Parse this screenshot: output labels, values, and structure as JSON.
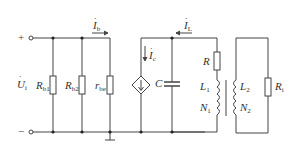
{
  "diagram": {
    "type": "small-signal equivalent circuit (tuned amplifier with transformer-coupled load)",
    "colors": {
      "wire": "#444444",
      "background": "#ffffff",
      "text": "#333333"
    },
    "terminals": {
      "plus": "+",
      "minus": "−",
      "input_voltage": {
        "main": "U",
        "sub": "i",
        "dot": "·"
      }
    },
    "components": {
      "rb1": {
        "main": "R",
        "sub": "b1"
      },
      "rb2": {
        "main": "R",
        "sub": "b2"
      },
      "rbe": {
        "main": "r",
        "sub": "be"
      },
      "ib": {
        "main": "I",
        "sub": "b",
        "dot": "·"
      },
      "ic": {
        "main": "I",
        "sub": "c",
        "dot": "·"
      },
      "il": {
        "main": "I",
        "sub": "L",
        "dot": "·"
      },
      "c": {
        "main": "C"
      },
      "r": {
        "main": "R"
      },
      "l1": {
        "main": "L",
        "sub": "1"
      },
      "n1": {
        "main": "N",
        "sub": "1"
      },
      "l2": {
        "main": "L",
        "sub": "2"
      },
      "n2": {
        "main": "N",
        "sub": "2"
      },
      "ri": {
        "main": "R",
        "sub": "i"
      }
    }
  }
}
